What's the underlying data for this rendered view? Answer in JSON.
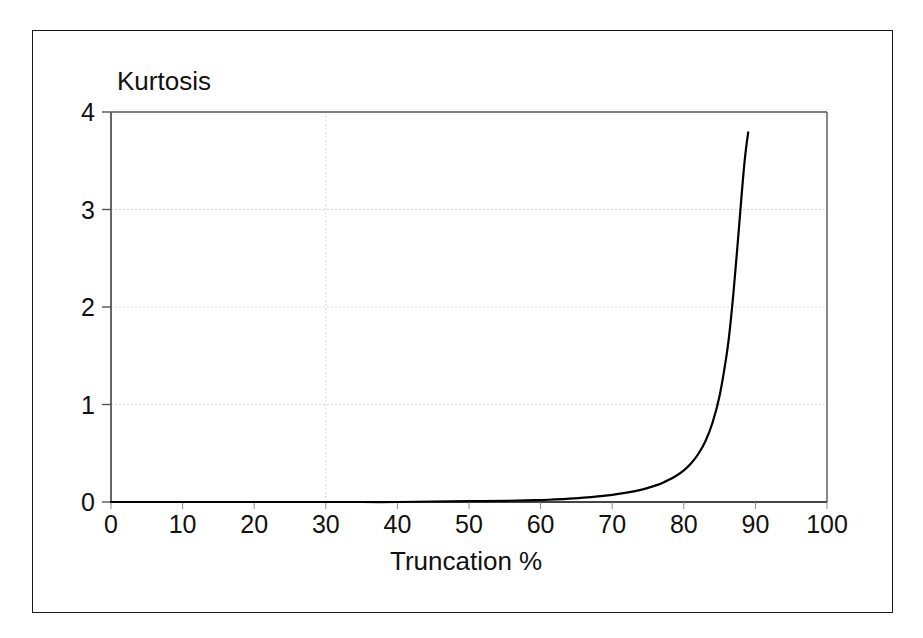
{
  "figure": {
    "background_color": "#ffffff",
    "frame_color": "#1a1a1a",
    "curve_color": "#000000",
    "gridline_color": "#cccccc",
    "axis_color": "#555555"
  },
  "chart_data": {
    "type": "line",
    "title": "",
    "xlabel": "Truncation %",
    "ylabel": "Kurtosis",
    "xlim": [
      0,
      100
    ],
    "ylim": [
      0,
      4
    ],
    "xticks": [
      0,
      10,
      20,
      30,
      40,
      50,
      60,
      70,
      80,
      90,
      100
    ],
    "xtick_labels": [
      "0",
      "10",
      "20",
      "30",
      "40",
      "50",
      "60",
      "70",
      "80",
      "90",
      "100"
    ],
    "yticks": [
      0,
      1,
      2,
      3,
      4
    ],
    "ytick_labels": [
      "0",
      "1",
      "2",
      "3",
      "4"
    ],
    "grid": {
      "horizontal": [
        1,
        2,
        3
      ],
      "vertical": [
        30
      ],
      "style": "dotted"
    },
    "legend": null,
    "legend_position": "none",
    "series": [
      {
        "name": "Kurtosis vs Truncation",
        "x": [
          0,
          5,
          10,
          15,
          20,
          25,
          30,
          35,
          40,
          45,
          50,
          55,
          58,
          60,
          62,
          64,
          66,
          68,
          70,
          72,
          74,
          75,
          76,
          77,
          78,
          79,
          80,
          81,
          82,
          83,
          84,
          85,
          86,
          86.5,
          87,
          87.5,
          88,
          88.25,
          88.5,
          88.75,
          89
        ],
        "y": [
          0.0,
          0.0,
          0.0,
          0.0,
          0.0,
          0.0,
          0.0,
          0.0,
          0.0,
          0.005,
          0.008,
          0.012,
          0.016,
          0.02,
          0.026,
          0.034,
          0.044,
          0.057,
          0.074,
          0.096,
          0.125,
          0.145,
          0.168,
          0.196,
          0.23,
          0.272,
          0.325,
          0.395,
          0.49,
          0.62,
          0.81,
          1.09,
          1.52,
          1.82,
          2.2,
          2.63,
          3.08,
          3.3,
          3.5,
          3.66,
          3.79
        ]
      }
    ]
  }
}
